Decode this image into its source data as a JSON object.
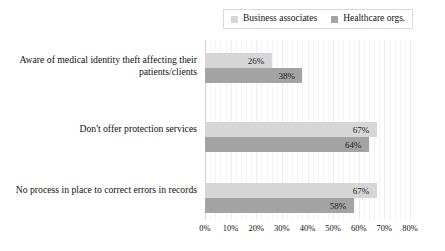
{
  "legend": {
    "position": "top",
    "entries": [
      {
        "label": "Business associates",
        "color": "#d6d6d6",
        "icon": "square-marker-icon"
      },
      {
        "label": "Healthcare orgs.",
        "color": "#a3a3a3",
        "icon": "square-marker-icon"
      }
    ]
  },
  "axis": {
    "ticks": [
      "0%",
      "10%",
      "20%",
      "30%",
      "40%",
      "50%",
      "60%",
      "70%",
      "80%"
    ],
    "tick_values": [
      0,
      10,
      20,
      30,
      40,
      50,
      60,
      70,
      80
    ]
  },
  "categories": [
    "Aware of medical identity theft affecting their patients/clients",
    "Don't offer protection services",
    "No process in place to correct errors in records"
  ],
  "bars": [
    {
      "value": 26,
      "label": "26%",
      "series": "Business associates"
    },
    {
      "value": 38,
      "label": "38%",
      "series": "Healthcare orgs."
    },
    {
      "value": 67,
      "label": "67%",
      "series": "Business associates"
    },
    {
      "value": 64,
      "label": "64%",
      "series": "Healthcare orgs."
    },
    {
      "value": 67,
      "label": "67%",
      "series": "Business associates"
    },
    {
      "value": 58,
      "label": "58%",
      "series": "Healthcare orgs."
    }
  ],
  "chart_data": {
    "type": "bar",
    "orientation": "horizontal",
    "title": "",
    "subtitle": "",
    "xlabel": "",
    "ylabel": "",
    "xlim": [
      0,
      80
    ],
    "grid": true,
    "grid_axis": "x",
    "legend_position": "top",
    "categories": [
      "Aware of medical identity theft affecting their patients/clients",
      "Don't offer protection services",
      "No process in place to correct errors in records"
    ],
    "series": [
      {
        "name": "Business associates",
        "color": "#d6d6d6",
        "values": [
          26,
          67,
          67
        ]
      },
      {
        "name": "Healthcare orgs.",
        "color": "#a3a3a3",
        "values": [
          38,
          64,
          58
        ]
      }
    ],
    "data_labels": [
      [
        "26%",
        "67%",
        "67%"
      ],
      [
        "38%",
        "64%",
        "58%"
      ]
    ],
    "tick_labels": [
      "0%",
      "10%",
      "20%",
      "30%",
      "40%",
      "50%",
      "60%",
      "70%",
      "80%"
    ]
  }
}
